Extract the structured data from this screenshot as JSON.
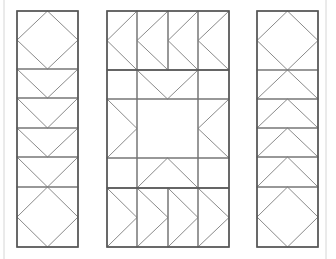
{
  "diagram": {
    "type": "quilt-pattern",
    "width": 336,
    "height": 259,
    "colors": {
      "background": "#ffffff",
      "frame": "#555555",
      "grid": "#777777",
      "diagonal": "#8a8a8a",
      "page_edge": "#d6d6d6"
    },
    "page_edges": [
      {
        "x1": 4,
        "y1": 0,
        "x2": 4,
        "y2": 259
      },
      {
        "x1": 326,
        "y1": 0,
        "x2": 326,
        "y2": 259
      }
    ],
    "panels": [
      {
        "name": "left-border-column",
        "rect": [
          17,
          11,
          78,
          247
        ],
        "rows": [
          69,
          98,
          128,
          157,
          187
        ],
        "cols": [],
        "blocks": [
          {
            "kind": "square-in-square",
            "rect": [
              17,
              11,
              78,
              69
            ]
          },
          {
            "kind": "goose-down",
            "rect": [
              17,
              69,
              78,
              98
            ]
          },
          {
            "kind": "goose-down",
            "rect": [
              17,
              98,
              78,
              128
            ]
          },
          {
            "kind": "goose-down",
            "rect": [
              17,
              128,
              78,
              157
            ]
          },
          {
            "kind": "goose-down",
            "rect": [
              17,
              157,
              78,
              187
            ]
          },
          {
            "kind": "square-in-square",
            "rect": [
              17,
              187,
              78,
              247
            ]
          }
        ]
      },
      {
        "name": "center-star-panel",
        "rect": [
          107,
          11,
          229,
          247
        ],
        "rows": [
          70,
          99,
          158,
          188
        ],
        "cols_top": [
          137,
          168,
          198
        ],
        "cols_mid": [
          137,
          198
        ],
        "cols_bottom": [
          137,
          168,
          198
        ],
        "blocks": [
          {
            "kind": "goose-left",
            "rect": [
              107,
              11,
              137,
              70
            ]
          },
          {
            "kind": "goose-left",
            "rect": [
              137,
              11,
              168,
              70
            ]
          },
          {
            "kind": "goose-left",
            "rect": [
              168,
              11,
              198,
              70
            ]
          },
          {
            "kind": "goose-left",
            "rect": [
              198,
              11,
              229,
              70
            ]
          },
          {
            "kind": "goose-down",
            "rect": [
              137,
              70,
              198,
              99
            ]
          },
          {
            "kind": "goose-right",
            "rect": [
              107,
              99,
              137,
              158
            ]
          },
          {
            "kind": "goose-left",
            "rect": [
              198,
              99,
              229,
              158
            ]
          },
          {
            "kind": "goose-up",
            "rect": [
              137,
              158,
              198,
              188
            ]
          },
          {
            "kind": "goose-right",
            "rect": [
              107,
              188,
              137,
              247
            ]
          },
          {
            "kind": "goose-right",
            "rect": [
              137,
              188,
              168,
              247
            ]
          },
          {
            "kind": "goose-right",
            "rect": [
              168,
              188,
              198,
              247
            ]
          },
          {
            "kind": "goose-right",
            "rect": [
              198,
              188,
              229,
              247
            ]
          }
        ]
      },
      {
        "name": "right-border-column",
        "rect": [
          257,
          11,
          318,
          247
        ],
        "rows": [
          70,
          99,
          128,
          157,
          187
        ],
        "cols": [],
        "blocks": [
          {
            "kind": "square-in-square",
            "rect": [
              257,
              11,
              318,
              70
            ]
          },
          {
            "kind": "goose-up",
            "rect": [
              257,
              70,
              318,
              99
            ]
          },
          {
            "kind": "goose-up",
            "rect": [
              257,
              99,
              318,
              128
            ]
          },
          {
            "kind": "goose-up",
            "rect": [
              257,
              128,
              318,
              157
            ]
          },
          {
            "kind": "goose-up",
            "rect": [
              257,
              157,
              318,
              187
            ]
          },
          {
            "kind": "square-in-square",
            "rect": [
              257,
              187,
              318,
              247
            ]
          }
        ]
      }
    ]
  }
}
